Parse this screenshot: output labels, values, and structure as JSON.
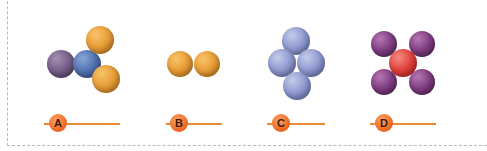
{
  "diagram": {
    "title": "",
    "molecules": [
      {
        "id": "A",
        "label": "A",
        "atoms": [
          {
            "color": "purple-grey",
            "x": 61,
            "y": 64,
            "r": 14
          },
          {
            "color": "blue",
            "x": 87,
            "y": 64,
            "r": 14
          },
          {
            "color": "orange",
            "x": 100,
            "y": 40,
            "r": 14
          },
          {
            "color": "orange",
            "x": 106,
            "y": 79,
            "r": 14
          }
        ]
      },
      {
        "id": "B",
        "label": "B",
        "atoms": [
          {
            "color": "orange",
            "x": 180,
            "y": 64,
            "r": 13
          },
          {
            "color": "orange",
            "x": 207,
            "y": 64,
            "r": 13
          }
        ]
      },
      {
        "id": "C",
        "label": "C",
        "atoms": [
          {
            "color": "lavender",
            "x": 296,
            "y": 41,
            "r": 14
          },
          {
            "color": "lavender",
            "x": 282,
            "y": 63,
            "r": 14
          },
          {
            "color": "lavender",
            "x": 311,
            "y": 63,
            "r": 14
          },
          {
            "color": "lavender",
            "x": 297,
            "y": 86,
            "r": 14
          }
        ]
      },
      {
        "id": "D",
        "label": "D",
        "atoms": [
          {
            "color": "purple",
            "x": 384,
            "y": 44,
            "r": 13
          },
          {
            "color": "purple",
            "x": 422,
            "y": 44,
            "r": 13
          },
          {
            "color": "purple",
            "x": 384,
            "y": 82,
            "r": 13
          },
          {
            "color": "purple",
            "x": 422,
            "y": 82,
            "r": 13
          },
          {
            "color": "red",
            "x": 403,
            "y": 63,
            "r": 14
          }
        ]
      }
    ],
    "answer_labels": [
      {
        "letter": "A",
        "line_x1": 44,
        "line_x2": 120,
        "dot_x": 58,
        "y": 123
      },
      {
        "letter": "B",
        "line_x1": 166,
        "line_x2": 222,
        "dot_x": 179,
        "y": 123
      },
      {
        "letter": "C",
        "line_x1": 267,
        "line_x2": 325,
        "dot_x": 281,
        "y": 123
      },
      {
        "letter": "D",
        "line_x1": 370,
        "line_x2": 436,
        "dot_x": 384,
        "y": 123
      }
    ],
    "colors": {
      "orange": "#e9a03a",
      "blue": "#4f70ae",
      "purple-grey": "#735d86",
      "lavender": "#8e98cf",
      "purple": "#7e3c80",
      "red": "#e0403a",
      "label_accent": "#f06b25",
      "border": "#b7bcb2"
    }
  }
}
